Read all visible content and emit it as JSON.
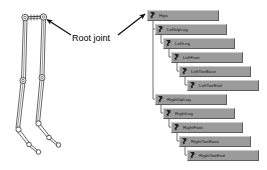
{
  "figure": {
    "annotation_label": "Root joint",
    "annotation_icon": "arrow-icon",
    "skeleton_icon": "skeleton-legs-icon",
    "colors": {
      "node_fill": "#9b9b9b",
      "node_highlight": "#c9c9c9",
      "node_shadow": "#5d5d5d",
      "line": "#4a4a4a",
      "text": "#121212",
      "background": "#ffffff"
    }
  },
  "tree": {
    "root_label": "Hips",
    "nodes": [
      {
        "label": "Hips",
        "depth": 0,
        "icon": "bone-joint-icon"
      },
      {
        "label": "LeftUpLeg",
        "depth": 1,
        "icon": "bone-joint-icon"
      },
      {
        "label": "LeftLeg",
        "depth": 2,
        "icon": "bone-joint-icon"
      },
      {
        "label": "LeftFoot",
        "depth": 3,
        "icon": "bone-joint-icon"
      },
      {
        "label": "LeftToeBase",
        "depth": 4,
        "icon": "bone-joint-icon"
      },
      {
        "label": "LeftToeEnd",
        "depth": 5,
        "icon": "bone-joint-icon"
      },
      {
        "label": "RightUpLeg",
        "depth": 1,
        "icon": "bone-joint-icon"
      },
      {
        "label": "RightLeg",
        "depth": 2,
        "icon": "bone-joint-icon"
      },
      {
        "label": "RightFoot",
        "depth": 3,
        "icon": "bone-joint-icon"
      },
      {
        "label": "RightToeBase",
        "depth": 4,
        "icon": "bone-joint-icon"
      },
      {
        "label": "RightToeEnd",
        "depth": 5,
        "icon": "bone-joint-icon"
      }
    ]
  }
}
